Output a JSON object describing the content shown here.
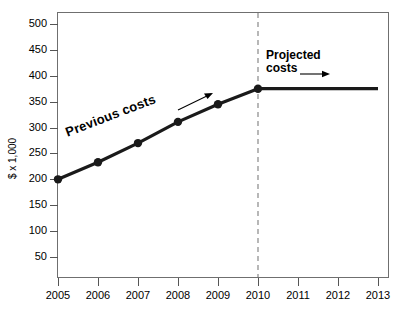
{
  "chart_data": {
    "type": "line",
    "title": "",
    "xlabel": "",
    "ylabel": "$ x 1,000",
    "x": [
      2005,
      2006,
      2007,
      2008,
      2009,
      2010,
      2011,
      2012,
      2013
    ],
    "xtick_labels": [
      "2005",
      "2006",
      "2007",
      "2008",
      "2009",
      "2010",
      "2011",
      "2012",
      "2013"
    ],
    "ytick_labels": [
      "50",
      "100",
      "150",
      "200",
      "250",
      "300",
      "350",
      "400",
      "450",
      "500"
    ],
    "ytick_values": [
      50,
      100,
      150,
      200,
      250,
      300,
      350,
      400,
      450,
      500
    ],
    "ylim": [
      0,
      525
    ],
    "xlim": [
      2004.7,
      2013.3
    ],
    "grid": false,
    "legend_position": "none",
    "series": [
      {
        "name": "Previous costs",
        "style": "solid-with-markers",
        "color": "#1a1a1a",
        "x": [
          2005,
          2006,
          2007,
          2008,
          2009,
          2010
        ],
        "values": [
          200,
          233,
          270,
          311,
          345,
          375
        ]
      },
      {
        "name": "Projected costs",
        "style": "solid-flat",
        "color": "#1a1a1a",
        "x": [
          2010,
          2013
        ],
        "values": [
          375,
          375
        ]
      }
    ],
    "annotations": [
      {
        "name": "previous-costs-label",
        "text": "Previous costs",
        "rotation": -21,
        "arrow": "up-right"
      },
      {
        "name": "projected-costs-label",
        "text_line1": "Projected",
        "text_line2": "costs",
        "rotation": 0,
        "arrow": "right"
      },
      {
        "name": "divider-line",
        "text": "",
        "at_x": 2010,
        "style": "dashed-vertical",
        "color": "#9a9a9a"
      }
    ]
  },
  "colors": {
    "line": "#1a1a1a",
    "marker": "#1a1a1a",
    "divider": "#9a9a9a",
    "frame": "#6f6f6f",
    "tick": "#555555",
    "text": "#000000",
    "background": "#ffffff"
  }
}
